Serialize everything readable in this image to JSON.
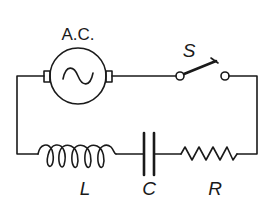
{
  "diagram": {
    "type": "series RLC circuit",
    "labels": {
      "source": "A.C.",
      "switch": "S",
      "inductor": "L",
      "capacitor": "C",
      "resistor": "R"
    },
    "components": [
      {
        "id": "source",
        "kind": "ac-source",
        "symbol": "~"
      },
      {
        "id": "switch",
        "kind": "switch",
        "state": "open"
      },
      {
        "id": "inductor",
        "kind": "inductor",
        "turns": 5
      },
      {
        "id": "capacitor",
        "kind": "capacitor"
      },
      {
        "id": "resistor",
        "kind": "resistor",
        "zigzags": 4
      }
    ],
    "colors": {
      "ink": "#1a1a1a",
      "background": "#ffffff"
    }
  }
}
